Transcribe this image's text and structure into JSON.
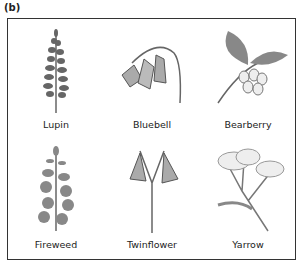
{
  "figure_label": "(b)",
  "plants": [
    {
      "name": "Lupin",
      "icon": "lupin-illustration"
    },
    {
      "name": "Bluebell",
      "icon": "bluebell-illustration"
    },
    {
      "name": "Bearberry",
      "icon": "bearberry-illustration"
    },
    {
      "name": "Fireweed",
      "icon": "fireweed-illustration"
    },
    {
      "name": "Twinflower",
      "icon": "twinflower-illustration"
    },
    {
      "name": "Yarrow",
      "icon": "yarrow-illustration"
    }
  ]
}
